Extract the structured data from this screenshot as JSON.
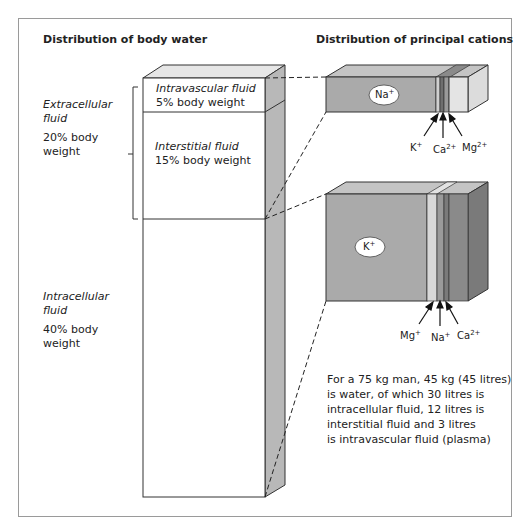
{
  "title_left": "Distribution of body water",
  "title_right": "Distribution of principal cations",
  "compartments": {
    "extracellular": {
      "name": "Extracellular",
      "name2": "fluid",
      "pct": "20% body",
      "pct2": "weight"
    },
    "intravascular": {
      "name": "Intravascular fluid",
      "pct": "5% body weight"
    },
    "interstitial": {
      "name": "Interstitial fluid",
      "pct": "15% body weight"
    },
    "intracellular": {
      "name": "Intracellular",
      "name2": "fluid",
      "pct": "40% body",
      "pct2": "weight"
    }
  },
  "extracellular_cations": {
    "main": {
      "ion": "Na",
      "charge": "+"
    },
    "arrows": [
      {
        "ion": "K",
        "charge": "+"
      },
      {
        "ion": "Ca",
        "charge": "2+"
      },
      {
        "ion": "Mg",
        "charge": "2+"
      }
    ]
  },
  "intracellular_cations": {
    "main": {
      "ion": "K",
      "charge": "+"
    },
    "arrows": [
      {
        "ion": "Mg",
        "charge": "+"
      },
      {
        "ion": "Na",
        "charge": "+"
      },
      {
        "ion": "Ca",
        "charge": "2+"
      }
    ]
  },
  "note": {
    "line1": "For a 75 kg man, 45 kg (45 litres)",
    "line2": "is water, of which 30 litres is",
    "line3": "intracellular fluid, 12 litres is",
    "line4": "interstitial fluid and 3 litres",
    "line5": "is intravascular fluid (plasma)"
  },
  "colors": {
    "bar_front": "#aaaaaa",
    "bar_top": "#c2c2c2",
    "column_side": "#b8b8b8",
    "light_band": "#d8d8d8",
    "mid_band": "#8e8e8e",
    "dark_band": "#6e6e6e",
    "depth_dark": "#7a7a7a"
  }
}
